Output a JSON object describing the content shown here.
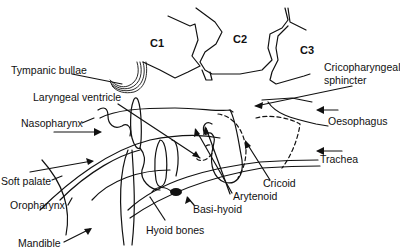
{
  "diagram": {
    "type": "anatomical line drawing",
    "vertebrae": [
      {
        "id": "c1",
        "label": "C1"
      },
      {
        "id": "c2",
        "label": "C2"
      },
      {
        "id": "c3",
        "label": "C3"
      }
    ],
    "labels": {
      "tympanic_bullae": "Tympanic bullae",
      "laryngeal_ventricle": "Laryngeal ventricle",
      "nasopharynx": "Nasopharynx",
      "soft_palate": "Soft palate",
      "oropharynx": "Oropharynx",
      "mandible": "Mandible",
      "hyoid_bones": "Hyoid bones",
      "basi_hyoid": "Basi-hyoid",
      "arytenoid": "Arytenoid",
      "cricoid": "Cricoid",
      "trachea": "Trachea",
      "oesophagus": "Oesophagus",
      "cricopharyngeal_sphincter_line1": "Cricopharyngeal",
      "cricopharyngeal_sphincter_line2": "sphincter"
    }
  }
}
